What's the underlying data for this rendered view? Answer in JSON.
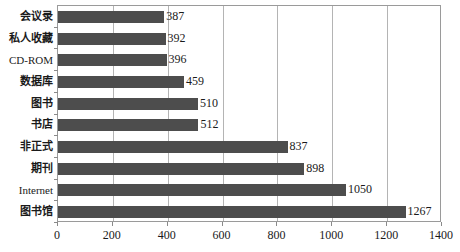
{
  "chart_data": {
    "type": "bar",
    "orientation": "horizontal",
    "title": "",
    "subtitle": "",
    "xlabel": "",
    "ylabel": "",
    "xlim": [
      0,
      1400
    ],
    "xticks": [
      0,
      200,
      400,
      600,
      800,
      1000,
      1200,
      1400
    ],
    "xtick_labels": [
      "0",
      "200",
      "400",
      "600",
      "800",
      "1000",
      "1200",
      "1400"
    ],
    "grid": "vertical",
    "legend": "none",
    "bar_color": "#4d4d4d",
    "gridline_color": "#b4b4b4",
    "axis_color": "#9a9a9a",
    "categories": [
      "会议录",
      "私人收藏",
      "CD-ROM",
      "数据库",
      "图书",
      "书店",
      "非正式",
      "期刊",
      "Internet",
      "图书馆"
    ],
    "values": [
      387,
      392,
      396,
      459,
      510,
      512,
      837,
      898,
      1050,
      1267
    ],
    "value_labels": [
      "387",
      "392",
      "396",
      "459",
      "510",
      "512",
      "837",
      "898",
      "1050",
      "1267"
    ],
    "data_points": [
      {
        "category": "会议录",
        "value": 387,
        "label": "387"
      },
      {
        "category": "私人收藏",
        "value": 392,
        "label": "392"
      },
      {
        "category": "CD-ROM",
        "value": 396,
        "label": "396"
      },
      {
        "category": "数据库",
        "value": 459,
        "label": "459"
      },
      {
        "category": "图书",
        "value": 510,
        "label": "510"
      },
      {
        "category": "书店",
        "value": 512,
        "label": "512"
      },
      {
        "category": "非正式",
        "value": 837,
        "label": "837"
      },
      {
        "category": "期刊",
        "value": 898,
        "label": "898"
      },
      {
        "category": "Internet",
        "value": 1050,
        "label": "1050"
      },
      {
        "category": "图书馆",
        "value": 1267,
        "label": "1267"
      }
    ]
  }
}
